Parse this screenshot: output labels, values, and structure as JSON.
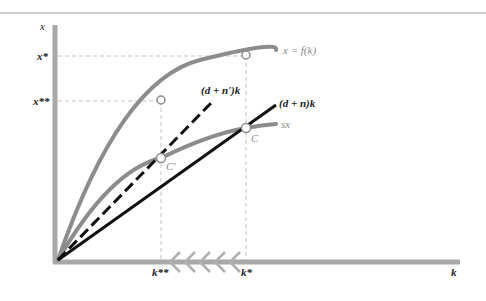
{
  "figure": {
    "type": "solow-growth-diagram",
    "axes": {
      "y_label": "x",
      "x_label": "k"
    },
    "y_ticks": [
      {
        "label": "x*",
        "y": 56
      },
      {
        "label": "x**",
        "y": 101
      }
    ],
    "x_ticks": [
      {
        "label": "k**",
        "x": 161
      },
      {
        "label": "k*",
        "x": 246
      }
    ],
    "curves": {
      "production": {
        "label": "x = f(k)",
        "color": "#8c8c8c"
      },
      "savings": {
        "label": "sx",
        "color": "#8c8c8c"
      },
      "break_even_original": {
        "label": "(d + n)k",
        "color": "#111111"
      },
      "break_even_new": {
        "label": "(d + n')k",
        "color": "#111111",
        "style": "dashed"
      }
    },
    "points": {
      "steady_state_original": "C",
      "steady_state_new": "C'"
    },
    "arrow_note": "leftward chevrons along k-axis from k* to k**",
    "colors": {
      "axis": "#a8a8a8",
      "curve_grey": "#8c8c8c",
      "line_black": "#111111",
      "guide": "#b5b5b5",
      "top_rule": "#9a9a9a"
    }
  }
}
